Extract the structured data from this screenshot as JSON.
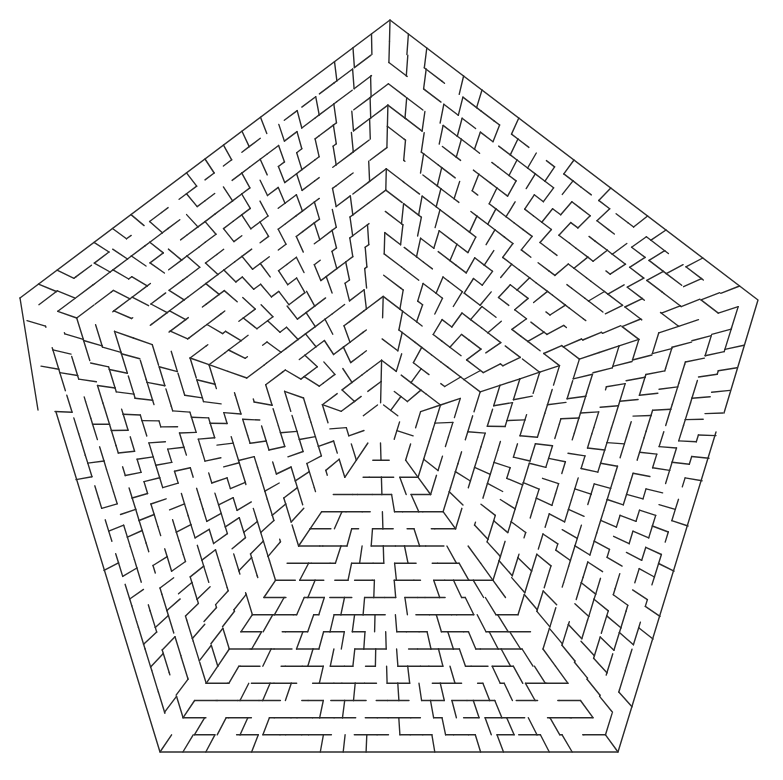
{
  "puzzle": {
    "type": "pentagonal-maze",
    "caption_clipped": "",
    "stroke_color": "#2a2a2a",
    "background_color": "#ffffff",
    "center": [
      380,
      425
    ],
    "outer_vertices": [
      [
        390,
        20
      ],
      [
        758,
        300
      ],
      [
        618,
        752
      ],
      [
        160,
        752
      ],
      [
        20,
        298
      ]
    ],
    "ring_count": 18,
    "inner_radius_ratio": 0.055,
    "sectors_per_side_outer": 20,
    "openings": [
      {
        "side": "left",
        "from": [
          38,
          410
        ],
        "to": [
          56,
          412
        ],
        "label": "entrance"
      },
      {
        "side": "right",
        "from": [
          724,
          413
        ],
        "to": [
          716,
          432
        ],
        "label": "exit"
      }
    ],
    "generator_seed": 7919
  }
}
